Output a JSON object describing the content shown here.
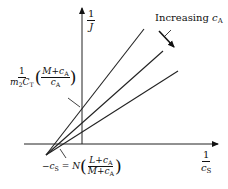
{
  "diagram": {
    "type": "lineweaver-burk-plot",
    "y_axis_label": {
      "num": "1",
      "den": "J"
    },
    "x_axis_label": {
      "num": "1",
      "den_var": "c",
      "den_sub": "S"
    },
    "annotation_increasing": {
      "text": "Increasing",
      "var": "c",
      "sub": "A"
    },
    "y_intercept_label": {
      "frac_num": "1",
      "frac_den_a": "m",
      "frac_den_a_sub": "2",
      "frac_den_b": "C",
      "frac_den_b_sub": "T",
      "paren_num": "M+c",
      "paren_num_sub": "A",
      "paren_den": "c",
      "paren_den_sub": "A"
    },
    "x_intercept_label": {
      "lhs": "−c",
      "lhs_sub": "S",
      "eq": "= N",
      "paren_num": "L+c",
      "paren_num_sub": "A",
      "paren_den": "M+c",
      "paren_den_sub": "A"
    },
    "lines": [
      {
        "name": "line-1",
        "x1": 46,
        "y1": 155,
        "x2": 144,
        "y2": 29
      },
      {
        "name": "line-2",
        "x1": 46,
        "y1": 155,
        "x2": 163,
        "y2": 51
      },
      {
        "name": "line-3",
        "x1": 46,
        "y1": 155,
        "x2": 178,
        "y2": 71
      }
    ]
  }
}
